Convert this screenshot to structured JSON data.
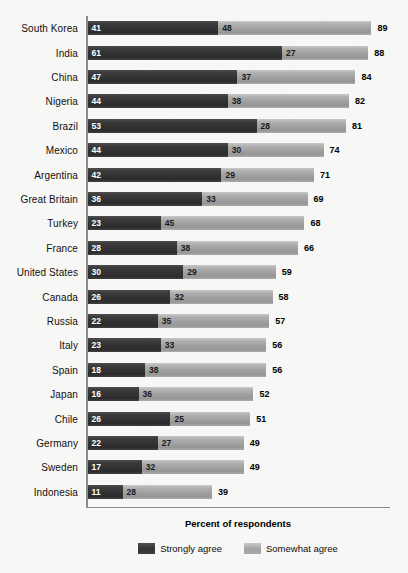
{
  "chart_data": {
    "type": "bar",
    "subtype": "stacked-horizontal",
    "title": "",
    "xlabel": "Percent of respondents",
    "ylabel": "",
    "xlim": [
      0,
      95
    ],
    "grid": false,
    "legend_position": "bottom-center",
    "categories": [
      "South Korea",
      "India",
      "China",
      "Nigeria",
      "Brazil",
      "Mexico",
      "Argentina",
      "Great Britain",
      "Turkey",
      "France",
      "United States",
      "Canada",
      "Russia",
      "Italy",
      "Spain",
      "Japan",
      "Chile",
      "Germany",
      "Sweden",
      "Indonesia"
    ],
    "series": [
      {
        "name": "Strongly agree",
        "color": "#333333",
        "values": [
          41,
          61,
          47,
          44,
          53,
          44,
          42,
          36,
          23,
          28,
          30,
          26,
          22,
          23,
          18,
          16,
          26,
          22,
          17,
          11
        ]
      },
      {
        "name": "Somewhat agree",
        "color": "#a2a2a2",
        "values": [
          48,
          27,
          37,
          38,
          28,
          30,
          29,
          33,
          45,
          38,
          29,
          32,
          35,
          33,
          38,
          36,
          25,
          27,
          32,
          28
        ]
      }
    ],
    "totals": [
      89,
      88,
      84,
      82,
      81,
      74,
      71,
      69,
      68,
      66,
      59,
      58,
      57,
      56,
      56,
      52,
      51,
      49,
      49,
      39
    ],
    "rows": [
      {
        "label": "South Korea",
        "strongly_agree": 41,
        "somewhat_agree": 48,
        "total": 89
      },
      {
        "label": "India",
        "strongly_agree": 61,
        "somewhat_agree": 27,
        "total": 88
      },
      {
        "label": "China",
        "strongly_agree": 47,
        "somewhat_agree": 37,
        "total": 84
      },
      {
        "label": "Nigeria",
        "strongly_agree": 44,
        "somewhat_agree": 38,
        "total": 82
      },
      {
        "label": "Brazil",
        "strongly_agree": 53,
        "somewhat_agree": 28,
        "total": 81
      },
      {
        "label": "Mexico",
        "strongly_agree": 44,
        "somewhat_agree": 30,
        "total": 74
      },
      {
        "label": "Argentina",
        "strongly_agree": 42,
        "somewhat_agree": 29,
        "total": 71
      },
      {
        "label": "Great Britain",
        "strongly_agree": 36,
        "somewhat_agree": 33,
        "total": 69
      },
      {
        "label": "Turkey",
        "strongly_agree": 23,
        "somewhat_agree": 45,
        "total": 68
      },
      {
        "label": "France",
        "strongly_agree": 28,
        "somewhat_agree": 38,
        "total": 66
      },
      {
        "label": "United States",
        "strongly_agree": 30,
        "somewhat_agree": 29,
        "total": 59
      },
      {
        "label": "Canada",
        "strongly_agree": 26,
        "somewhat_agree": 32,
        "total": 58
      },
      {
        "label": "Russia",
        "strongly_agree": 22,
        "somewhat_agree": 35,
        "total": 57
      },
      {
        "label": "Italy",
        "strongly_agree": 23,
        "somewhat_agree": 33,
        "total": 56
      },
      {
        "label": "Spain",
        "strongly_agree": 18,
        "somewhat_agree": 38,
        "total": 56
      },
      {
        "label": "Japan",
        "strongly_agree": 16,
        "somewhat_agree": 36,
        "total": 52
      },
      {
        "label": "Chile",
        "strongly_agree": 26,
        "somewhat_agree": 25,
        "total": 51
      },
      {
        "label": "Germany",
        "strongly_agree": 22,
        "somewhat_agree": 27,
        "total": 49
      },
      {
        "label": "Sweden",
        "strongly_agree": 17,
        "somewhat_agree": 32,
        "total": 49
      },
      {
        "label": "Indonesia",
        "strongly_agree": 11,
        "somewhat_agree": 28,
        "total": 39
      }
    ]
  },
  "axis": {
    "title": "Percent of respondents"
  },
  "legend": {
    "items": [
      {
        "label": "Strongly agree",
        "color": "#333333"
      },
      {
        "label": "Somewhat agree",
        "color": "#a2a2a2"
      }
    ]
  }
}
